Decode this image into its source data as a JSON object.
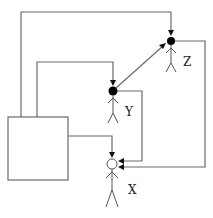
{
  "diagram": {
    "type": "causal-agent-graph",
    "background": "#ffffff",
    "box": {
      "label": ""
    },
    "nodes": [
      {
        "id": "Z",
        "label": "Z",
        "marker": "filled",
        "color": "#000000"
      },
      {
        "id": "Y",
        "label": "Y",
        "marker": "filled",
        "color": "#000000"
      },
      {
        "id": "X",
        "label": "X",
        "marker": "open",
        "color": "#ffffff"
      }
    ],
    "edges": [
      {
        "from": "box",
        "to": "Z",
        "route": "up-left, across top, down"
      },
      {
        "from": "box",
        "to": "Y",
        "route": "up, across, down"
      },
      {
        "from": "box",
        "to": "X",
        "route": "right, down"
      },
      {
        "from": "Y",
        "to": "Z",
        "route": "diagonal"
      },
      {
        "from": "Y",
        "to": "X",
        "route": "right, down, left"
      },
      {
        "from": "Z",
        "to": "X",
        "route": "right, down, left"
      }
    ]
  }
}
